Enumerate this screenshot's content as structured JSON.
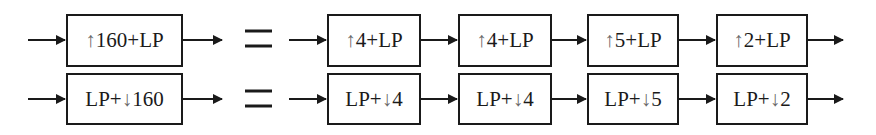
{
  "diagram": {
    "rows": [
      {
        "lhs": {
          "arrow": "↑",
          "pre": "",
          "post": "160+LP",
          "label": "↑160+LP"
        },
        "equals": "=",
        "rhs": [
          {
            "arrow": "↑",
            "pre": "",
            "post": "4+LP",
            "label": "↑4+LP"
          },
          {
            "arrow": "↑",
            "pre": "",
            "post": "4+LP",
            "label": "↑4+LP"
          },
          {
            "arrow": "↑",
            "pre": "",
            "post": "5+LP",
            "label": "↑5+LP"
          },
          {
            "arrow": "↑",
            "pre": "",
            "post": "2+LP",
            "label": "↑2+LP"
          }
        ]
      },
      {
        "lhs": {
          "arrow": "↓",
          "pre": "LP+",
          "post": "160",
          "label": "LP+↓160"
        },
        "equals": "=",
        "rhs": [
          {
            "arrow": "↓",
            "pre": "LP+",
            "post": "4",
            "label": "LP+↓4"
          },
          {
            "arrow": "↓",
            "pre": "LP+",
            "post": "4",
            "label": "LP+↓4"
          },
          {
            "arrow": "↓",
            "pre": "LP+",
            "post": "5",
            "label": "LP+↓5"
          },
          {
            "arrow": "↓",
            "pre": "LP+",
            "post": "2",
            "label": "LP+↓2"
          }
        ]
      }
    ],
    "colors": {
      "stroke": "#1a1a1a",
      "arrow_glyph": "#6a6a6a",
      "background": "#ffffff"
    }
  }
}
